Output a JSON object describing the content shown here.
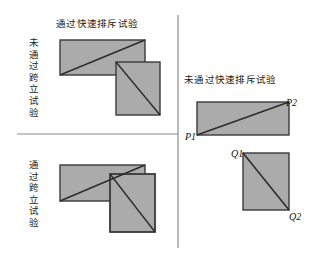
{
  "figure": {
    "background_color": "#ffffff",
    "shape_fill_color": "#ababab",
    "shape_stroke_color": "#3a3a3a",
    "divider_color": "#8a8a8a",
    "text_color": "#1b1b1b"
  },
  "panels": {
    "top_left": {
      "title": "通过快速排斥试验",
      "row_label": "未通过跨立试验"
    },
    "bottom_left": {
      "row_label": "通过跨立试验"
    },
    "right": {
      "title": "未通过快速排斥试验"
    }
  },
  "points": {
    "p1": "P1",
    "p2": "P2",
    "q1": "Q1",
    "q2": "Q2"
  },
  "shapes": {
    "top_left_rect": {
      "x": 60,
      "y": 40,
      "w": 85,
      "h": 35,
      "diagonal": "bottom-left-to-top-right"
    },
    "top_left_square": {
      "x": 116,
      "y": 62,
      "w": 44,
      "h": 53,
      "diagonal": "top-left-to-bottom-right"
    },
    "bottom_left_rect": {
      "x": 60,
      "y": 165,
      "w": 85,
      "h": 36,
      "diagonal": "bottom-left-to-top-right"
    },
    "bottom_left_square": {
      "x": 110,
      "y": 174,
      "w": 45,
      "h": 58,
      "diagonal": "top-left-to-bottom-right"
    },
    "right_rect": {
      "x": 197,
      "y": 102,
      "w": 92,
      "h": 33,
      "diagonal": "bottom-left-to-top-right"
    },
    "right_square": {
      "x": 243,
      "y": 153,
      "w": 46,
      "h": 57,
      "diagonal": "top-left-to-bottom-right"
    }
  },
  "dividers": {
    "vertical": {
      "x": 178,
      "y1": 15,
      "y2": 248
    },
    "horizontal": {
      "y": 134,
      "x1": 17,
      "x2": 178
    }
  }
}
